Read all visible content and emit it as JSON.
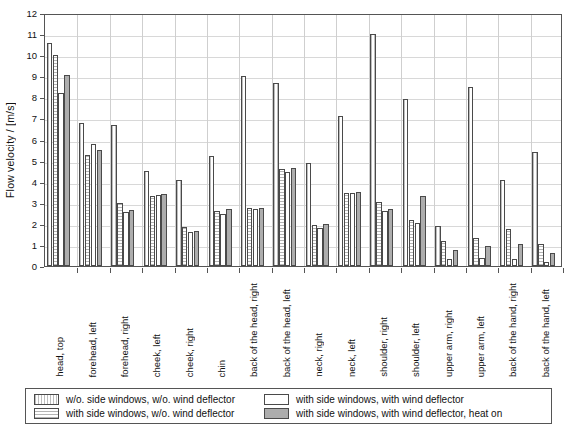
{
  "chart_data": {
    "type": "bar",
    "title": "",
    "xlabel": "",
    "ylabel": "Flow velocity / [m/s]",
    "ylim": [
      0,
      12
    ],
    "ytick_step": 1,
    "grid": true,
    "legend_position": "bottom",
    "categories": [
      "head, top",
      "forehead, left",
      "forehead, right",
      "cheek, left",
      "cheek, right",
      "chin",
      "back of the head, right",
      "back of the head, left",
      "neck, right",
      "neck, left",
      "shoulder, right",
      "shoulder, left",
      "upper arm, right",
      "upper arm, left",
      "back of the hand, right",
      "back of the hand, left"
    ],
    "ytick_labels": [
      "0",
      "1",
      "2",
      "3",
      "4",
      "5",
      "6",
      "7",
      "8",
      "9",
      "10",
      "11",
      "12"
    ],
    "series": [
      {
        "name": "w/o. side windows, w/o. wind deflector",
        "values": [
          10.6,
          6.8,
          6.7,
          4.5,
          4.1,
          5.2,
          9.0,
          8.7,
          4.9,
          7.1,
          11.0,
          7.9,
          1.9,
          8.5,
          4.1,
          5.4
        ]
      },
      {
        "name": "with side windows, w/o. wind deflector",
        "values": [
          10.0,
          5.25,
          3.0,
          3.3,
          1.85,
          2.6,
          2.75,
          4.6,
          1.95,
          3.45,
          3.05,
          2.2,
          1.2,
          1.35,
          1.75,
          1.05
        ]
      },
      {
        "name": "with side windows, with wind deflector",
        "values": [
          8.2,
          5.8,
          2.55,
          3.35,
          1.6,
          2.45,
          2.7,
          4.45,
          1.8,
          3.45,
          2.6,
          2.05,
          0.35,
          0.4,
          0.35,
          0.2
        ]
      },
      {
        "name": "with side windows, with wind deflector, heat on",
        "values": [
          9.05,
          5.5,
          2.65,
          3.4,
          1.65,
          2.7,
          2.75,
          4.65,
          2.0,
          3.5,
          2.7,
          3.3,
          0.75,
          0.95,
          1.05,
          0.6
        ]
      }
    ],
    "colors": {
      "series0": "#ffffff",
      "series1": "#fbfbfb",
      "series2": "#ffffff",
      "series3": "#adadad",
      "outline": "#4a4a4a",
      "gridline": "#d8d8d8",
      "axis": "#555555"
    }
  },
  "legend": {
    "entries": [
      "w/o. side windows, w/o. wind deflector",
      "with side windows, w/o. wind deflector",
      "with side windows, with wind deflector",
      "with side windows, with wind deflector, heat on"
    ]
  }
}
